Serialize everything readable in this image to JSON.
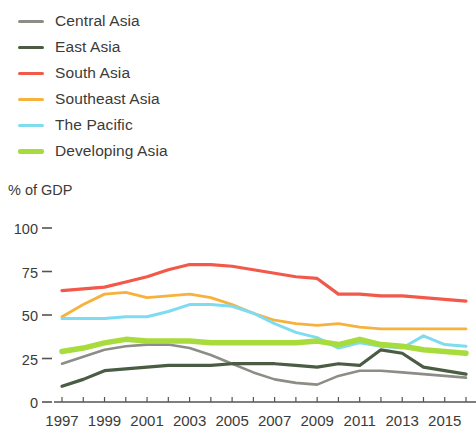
{
  "axis_unit": "% of GDP",
  "legend": {
    "items": [
      {
        "label": "Central Asia",
        "color": "#8d8d88",
        "weight": "thin"
      },
      {
        "label": "East Asia",
        "color": "#4a5c44",
        "weight": "thin"
      },
      {
        "label": "South Asia",
        "color": "#f2594a",
        "weight": "thin"
      },
      {
        "label": "Southeast Asia",
        "color": "#f6b23c",
        "weight": "thin"
      },
      {
        "label": "The Pacific",
        "color": "#7fdcf0",
        "weight": "thin"
      },
      {
        "label": "Developing Asia",
        "color": "#a8dc3c",
        "weight": "thick"
      }
    ]
  },
  "chart_data": {
    "type": "line",
    "title": "",
    "subtitle": "",
    "xlabel": "",
    "ylabel": "% of GDP",
    "grid": false,
    "legend_position": "top-left",
    "xlim": [
      1997,
      2016
    ],
    "ylim": [
      0,
      100
    ],
    "yticks": [
      100,
      75,
      50,
      25,
      0
    ],
    "ytick_labels": [
      "100",
      "75",
      "50",
      "25",
      "0"
    ],
    "x": [
      1997,
      1998,
      1999,
      2000,
      2001,
      2002,
      2003,
      2004,
      2005,
      2006,
      2007,
      2008,
      2009,
      2010,
      2011,
      2012,
      2013,
      2014,
      2015,
      2016
    ],
    "xtick_labels": [
      "1997",
      "1999",
      "2001",
      "2003",
      "2005",
      "2007",
      "2009",
      "2011",
      "2013",
      "2015"
    ],
    "xticks": [
      1997,
      1999,
      2001,
      2003,
      2005,
      2007,
      2009,
      2011,
      2013,
      2015
    ],
    "series": [
      {
        "name": "Central Asia",
        "color": "#8d8d88",
        "width": 2.6,
        "values": [
          22,
          26,
          30,
          32,
          33,
          33,
          31,
          27,
          22,
          17,
          13,
          11,
          10,
          15,
          18,
          18,
          17,
          16,
          15,
          14
        ]
      },
      {
        "name": "East Asia",
        "color": "#4a5c44",
        "width": 3.2,
        "values": [
          9,
          13,
          18,
          19,
          20,
          21,
          21,
          21,
          22,
          22,
          22,
          21,
          20,
          22,
          21,
          30,
          28,
          20,
          18,
          16
        ]
      },
      {
        "name": "South Asia",
        "color": "#f2594a",
        "width": 3.2,
        "values": [
          64,
          65,
          66,
          69,
          72,
          76,
          79,
          79,
          78,
          76,
          74,
          72,
          71,
          62,
          62,
          61,
          61,
          60,
          59,
          58
        ]
      },
      {
        "name": "Southeast Asia",
        "color": "#f6b23c",
        "width": 2.8,
        "values": [
          49,
          56,
          62,
          63,
          60,
          61,
          62,
          60,
          56,
          51,
          47,
          45,
          44,
          45,
          43,
          42,
          42,
          42,
          42,
          42
        ]
      },
      {
        "name": "The Pacific",
        "color": "#7fdcf0",
        "width": 3.0,
        "values": [
          48,
          48,
          48,
          49,
          49,
          52,
          56,
          56,
          55,
          51,
          45,
          40,
          37,
          31,
          34,
          32,
          31,
          38,
          33,
          32
        ]
      },
      {
        "name": "Developing Asia",
        "color": "#a8dc3c",
        "width": 5.5,
        "values": [
          29,
          31,
          34,
          36,
          35,
          35,
          35,
          34,
          34,
          34,
          34,
          34,
          35,
          33,
          36,
          33,
          32,
          30,
          29,
          28
        ]
      }
    ]
  }
}
